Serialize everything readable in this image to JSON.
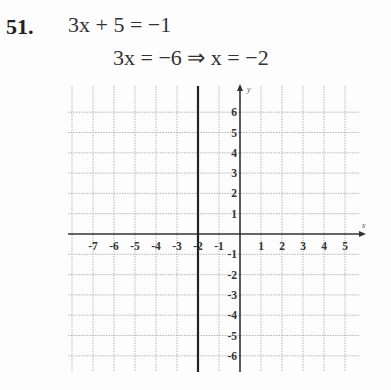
{
  "problem": {
    "number": "51.",
    "line1": "3x + 5 = −1",
    "line2": "3x = −6 ⇒ x = −2"
  },
  "graph": {
    "x_axis_label": "x",
    "y_axis_label": "y",
    "x_ticks": [
      "-7",
      "-6",
      "-5",
      "-4",
      "-3",
      "-2",
      "-1",
      "1",
      "2",
      "3",
      "4",
      "5"
    ],
    "y_ticks_pos": [
      "6",
      "5",
      "4",
      "3",
      "2",
      "1"
    ],
    "y_ticks_neg": [
      "-1",
      "-2",
      "-3",
      "-4",
      "-5",
      "-6"
    ],
    "vertical_line": "x = -2",
    "colors": {
      "grid": "#b5b5b5",
      "axis": "#333333",
      "line": "#222222"
    }
  },
  "chart_data": {
    "type": "line",
    "title": "",
    "xlabel": "x",
    "ylabel": "y",
    "xlim": [
      -8,
      5.8
    ],
    "ylim": [
      -6.7,
      7
    ],
    "grid": true,
    "series": [
      {
        "name": "x = -2",
        "x": [
          -2,
          -2
        ],
        "y": [
          -6.7,
          7
        ]
      }
    ],
    "x_tick_labels": [
      -7,
      -6,
      -5,
      -4,
      -3,
      -2,
      -1,
      1,
      2,
      3,
      4,
      5
    ],
    "y_tick_labels": [
      -6,
      -5,
      -4,
      -3,
      -2,
      -1,
      1,
      2,
      3,
      4,
      5,
      6
    ]
  }
}
